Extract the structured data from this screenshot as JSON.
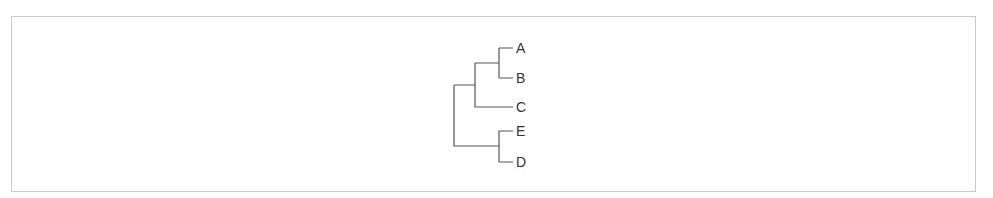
{
  "diagram": {
    "type": "dendrogram",
    "line_color": "#555555",
    "leaves": [
      {
        "label": "A"
      },
      {
        "label": "B"
      },
      {
        "label": "C"
      },
      {
        "label": "E"
      },
      {
        "label": "D"
      }
    ],
    "tree": "(((A,B),C),(E,D))"
  }
}
